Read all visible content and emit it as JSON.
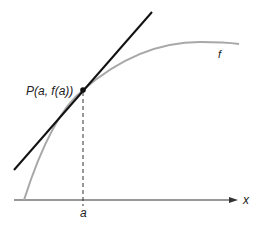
{
  "diagram": {
    "type": "tangent-line-diagram",
    "colors": {
      "curve": "#a8a8a8",
      "tangent": "#111111",
      "axis": "#333333",
      "point": "#111111",
      "dashed": "#333333"
    },
    "labels": {
      "point": "P(a, f(a))",
      "curve": "f",
      "x_axis": "x",
      "tick": "a"
    },
    "elements": {
      "curve": {
        "name": "f",
        "description": "increasing concave-down curve"
      },
      "tangent_line": {
        "through": "P(a, f(a))"
      },
      "vertical_dashed": {
        "from": "P",
        "to": "a on x-axis"
      }
    }
  }
}
